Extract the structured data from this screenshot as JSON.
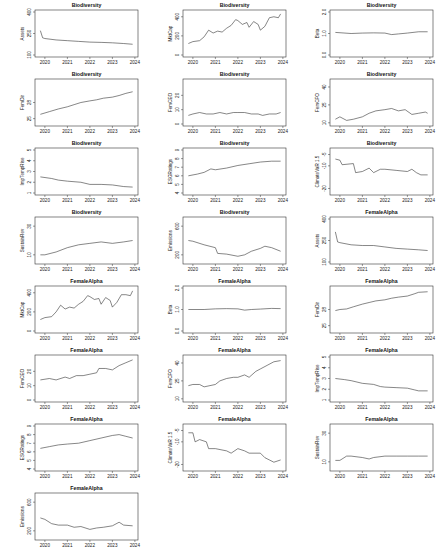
{
  "chart_data": [
    {
      "type": "line",
      "title": "Biodiversity",
      "ylabel": "Assets",
      "xlabel": "",
      "ylim": [
        100,
        400
      ],
      "yticks": [
        "100",
        "250",
        "400"
      ],
      "x_ticks": [
        "2020",
        "2021",
        "2022",
        "2023",
        "2024"
      ],
      "x": [
        2019.8,
        2019.9,
        2020.0,
        2020.5,
        2021.0,
        2021.5,
        2022.0,
        2022.5,
        2023.0,
        2023.5,
        2023.9
      ],
      "values": [
        270,
        220,
        215,
        205,
        200,
        195,
        190,
        188,
        185,
        180,
        175
      ]
    },
    {
      "type": "line",
      "title": "Biodiversity",
      "ylabel": "MktCap",
      "xlabel": "",
      "ylim": [
        0,
        450
      ],
      "yticks": [
        "0",
        "200",
        "400"
      ],
      "x_ticks": [
        "2020",
        "2021",
        "2022",
        "2023",
        "2024"
      ],
      "x": [
        2019.8,
        2020.0,
        2020.3,
        2020.5,
        2020.7,
        2020.9,
        2021.1,
        2021.3,
        2021.5,
        2021.7,
        2021.9,
        2022.0,
        2022.2,
        2022.4,
        2022.5,
        2022.7,
        2022.9,
        2023.0,
        2023.2,
        2023.4,
        2023.6,
        2023.8,
        2023.9
      ],
      "values": [
        120,
        140,
        150,
        190,
        260,
        230,
        250,
        240,
        280,
        310,
        370,
        360,
        320,
        340,
        290,
        350,
        320,
        260,
        300,
        390,
        400,
        390,
        430
      ]
    },
    {
      "type": "line",
      "title": "Biodiversity",
      "ylabel": "Beta",
      "xlabel": "",
      "ylim": [
        0.0,
        2.0
      ],
      "yticks": [
        "0.0",
        "1.0",
        "2.0"
      ],
      "x_ticks": [
        "2020",
        "2021",
        "2022",
        "2023",
        "2024"
      ],
      "x": [
        2019.8,
        2020.5,
        2021.0,
        2021.5,
        2022.0,
        2022.3,
        2022.6,
        2023.0,
        2023.5,
        2023.9
      ],
      "values": [
        1.05,
        1.0,
        1.02,
        1.03,
        1.02,
        0.95,
        0.98,
        1.02,
        1.08,
        1.08
      ]
    },
    {
      "type": "line",
      "title": "Biodiversity",
      "ylabel": "FemDir",
      "xlabel": "",
      "ylim": [
        24,
        32
      ],
      "yticks": [
        "25",
        "28"
      ],
      "x_ticks": [
        "2020",
        "2021",
        "2022",
        "2023",
        "2024"
      ],
      "x": [
        2019.8,
        2020.2,
        2020.6,
        2021.0,
        2021.3,
        2021.6,
        2022.0,
        2022.3,
        2022.6,
        2023.0,
        2023.3,
        2023.6,
        2023.9
      ],
      "values": [
        25.8,
        26.3,
        26.8,
        27.2,
        27.6,
        28.0,
        28.3,
        28.5,
        28.8,
        29.0,
        29.3,
        29.7,
        30.0
      ]
    },
    {
      "type": "line",
      "title": "Biodiversity",
      "ylabel": "FemCEO",
      "xlabel": "",
      "ylim": [
        0,
        30
      ],
      "yticks": [
        "0",
        "10",
        "20"
      ],
      "x_ticks": [
        "2020",
        "2021",
        "2022",
        "2023",
        "2024"
      ],
      "x": [
        2019.8,
        2020.0,
        2020.3,
        2020.6,
        2020.9,
        2021.2,
        2021.5,
        2021.8,
        2022.0,
        2022.3,
        2022.6,
        2022.9,
        2023.1,
        2023.4,
        2023.7,
        2023.9
      ],
      "values": [
        6,
        7,
        8,
        7,
        7,
        8,
        7,
        8,
        8,
        8,
        7,
        7,
        6,
        7,
        7,
        8
      ]
    },
    {
      "type": "line",
      "title": "Biodiversity",
      "ylabel": "FemCFO",
      "xlabel": "",
      "ylim": [
        9,
        45
      ],
      "yticks": [
        "10",
        "25",
        "40"
      ],
      "x_ticks": [
        "2020",
        "2021",
        "2022",
        "2023",
        "2024"
      ],
      "x": [
        2019.8,
        2020.0,
        2020.3,
        2020.6,
        2021.0,
        2021.3,
        2021.6,
        2022.0,
        2022.3,
        2022.6,
        2022.9,
        2023.2,
        2023.5,
        2023.8,
        2023.9
      ],
      "values": [
        13,
        15,
        12,
        13,
        15,
        18,
        20,
        21,
        22,
        20,
        21,
        17,
        18,
        19,
        18
      ]
    },
    {
      "type": "line",
      "title": "Biodiversity",
      "ylabel": "ImpTempRise",
      "xlabel": "",
      "ylim": [
        1,
        5
      ],
      "yticks": [
        "1",
        "2",
        "3",
        "4",
        "5"
      ],
      "x_ticks": [
        "2020",
        "2021",
        "2022",
        "2023",
        "2024"
      ],
      "x": [
        2019.8,
        2020.3,
        2020.6,
        2021.0,
        2021.6,
        2022.0,
        2022.5,
        2023.0,
        2023.5,
        2023.9
      ],
      "values": [
        2.5,
        2.35,
        2.2,
        2.1,
        2.0,
        1.8,
        1.8,
        1.75,
        1.6,
        1.55
      ]
    },
    {
      "type": "line",
      "title": "Biodiversity",
      "ylabel": "ESGRatings",
      "xlabel": "",
      "ylim": [
        4,
        9
      ],
      "yticks": [
        "4",
        "5",
        "6",
        "7",
        "8",
        "9"
      ],
      "x_ticks": [
        "2020",
        "2021",
        "2022",
        "2023",
        "2024"
      ],
      "x": [
        2019.8,
        2020.2,
        2020.5,
        2020.8,
        2021.0,
        2021.5,
        2022.0,
        2022.5,
        2023.0,
        2023.5,
        2023.9
      ],
      "values": [
        6.0,
        6.2,
        6.4,
        6.8,
        6.7,
        6.9,
        7.2,
        7.4,
        7.6,
        7.7,
        7.7
      ]
    },
    {
      "type": "line",
      "title": "Biodiversity",
      "ylabel": "ClimateVaR 1.5",
      "xlabel": "",
      "ylim": [
        -22,
        -3
      ],
      "yticks": [
        "-5",
        "-10",
        "-20"
      ],
      "x_ticks": [
        "2020",
        "2021",
        "2022",
        "2023",
        "2024"
      ],
      "x": [
        2019.8,
        2020.0,
        2020.1,
        2020.6,
        2020.7,
        2021.0,
        2021.3,
        2021.5,
        2021.8,
        2022.0,
        2022.5,
        2023.0,
        2023.2,
        2023.4,
        2023.6,
        2023.9
      ],
      "values": [
        -7,
        -7.5,
        -9.5,
        -9,
        -13,
        -12.5,
        -11,
        -13,
        -11.5,
        -11.5,
        -12,
        -12.5,
        -11.5,
        -13,
        -14,
        -14
      ]
    },
    {
      "type": "line",
      "title": "Biodiversity",
      "ylabel": "SustainRev",
      "xlabel": "",
      "ylim": [
        5,
        35
      ],
      "yticks": [
        "10",
        "30"
      ],
      "x_ticks": [
        "2020",
        "2021",
        "2022",
        "2023",
        "2024"
      ],
      "x": [
        2019.8,
        2020.0,
        2020.5,
        2021.0,
        2021.5,
        2022.0,
        2022.5,
        2023.0,
        2023.5,
        2023.9
      ],
      "values": [
        10,
        10,
        12,
        15,
        17,
        18,
        19,
        18,
        19,
        20
      ]
    },
    {
      "type": "line",
      "title": "Biodiversity",
      "ylabel": "Emissions",
      "xlabel": "",
      "ylim": [
        100,
        700
      ],
      "yticks": [
        "200",
        "600"
      ],
      "x_ticks": [
        "2020",
        "2021",
        "2022",
        "2023",
        "2024"
      ],
      "x": [
        2019.8,
        2020.0,
        2020.5,
        2021.0,
        2021.1,
        2021.5,
        2022.0,
        2022.3,
        2022.6,
        2023.0,
        2023.2,
        2023.5,
        2023.9
      ],
      "values": [
        400,
        390,
        340,
        300,
        220,
        210,
        180,
        200,
        250,
        290,
        320,
        300,
        250
      ]
    },
    {
      "type": "line",
      "title": "FemaleAlpha",
      "ylabel": "Assets",
      "xlabel": "",
      "ylim": [
        100,
        400
      ],
      "yticks": [
        "100",
        "250",
        "400"
      ],
      "x_ticks": [
        "2020",
        "2021",
        "2022",
        "2023",
        "2024"
      ],
      "x": [
        2019.8,
        2019.9,
        2020.0,
        2020.5,
        2021.0,
        2021.5,
        2022.0,
        2022.5,
        2023.0,
        2023.5,
        2023.9
      ],
      "values": [
        310,
        240,
        235,
        220,
        215,
        215,
        205,
        195,
        190,
        185,
        180
      ]
    },
    {
      "type": "line",
      "title": "FemaleAlpha",
      "ylabel": "MktCap",
      "xlabel": "",
      "ylim": [
        0,
        450
      ],
      "yticks": [
        "0",
        "200",
        "400"
      ],
      "x_ticks": [
        "2020",
        "2021",
        "2022",
        "2023",
        "2024"
      ],
      "x": [
        2019.8,
        2020.0,
        2020.3,
        2020.5,
        2020.7,
        2020.9,
        2021.1,
        2021.3,
        2021.5,
        2021.7,
        2021.9,
        2022.0,
        2022.2,
        2022.4,
        2022.5,
        2022.7,
        2022.9,
        2023.0,
        2023.2,
        2023.4,
        2023.6,
        2023.8,
        2023.9
      ],
      "values": [
        120,
        140,
        150,
        200,
        270,
        230,
        250,
        240,
        280,
        310,
        370,
        360,
        330,
        340,
        280,
        350,
        320,
        250,
        300,
        380,
        380,
        370,
        420
      ]
    },
    {
      "type": "line",
      "title": "FemaleAlpha",
      "ylabel": "Beta",
      "xlabel": "",
      "ylim": [
        0.0,
        2.0
      ],
      "yticks": [
        "0.0",
        "1.0",
        "2.0"
      ],
      "x_ticks": [
        "2020",
        "2021",
        "2022",
        "2023",
        "2024"
      ],
      "x": [
        2019.8,
        2020.5,
        2021.0,
        2021.5,
        2022.0,
        2022.3,
        2022.6,
        2023.0,
        2023.5,
        2023.9
      ],
      "values": [
        1.0,
        1.0,
        1.03,
        1.04,
        1.03,
        0.97,
        1.0,
        1.02,
        1.05,
        1.04
      ]
    },
    {
      "type": "line",
      "title": "FemaleAlpha",
      "ylabel": "FemDir",
      "xlabel": "",
      "ylim": [
        24,
        32
      ],
      "yticks": [
        "25",
        "28"
      ],
      "x_ticks": [
        "2020",
        "2021",
        "2022",
        "2023",
        "2024"
      ],
      "x": [
        2019.8,
        2020.0,
        2020.3,
        2020.6,
        2021.0,
        2021.3,
        2021.6,
        2022.0,
        2022.3,
        2022.6,
        2023.0,
        2023.3,
        2023.5,
        2023.9
      ],
      "values": [
        27.8,
        28.0,
        28.1,
        28.5,
        29.0,
        29.3,
        29.6,
        29.8,
        30.1,
        30.3,
        30.5,
        30.9,
        31.2,
        31.3
      ]
    },
    {
      "type": "line",
      "title": "FemaleAlpha",
      "ylabel": "FemCEO",
      "xlabel": "",
      "ylim": [
        0,
        30
      ],
      "yticks": [
        "0",
        "10",
        "20"
      ],
      "x_ticks": [
        "2020",
        "2021",
        "2022",
        "2023",
        "2024"
      ],
      "x": [
        2019.8,
        2020.2,
        2020.5,
        2020.9,
        2021.1,
        2021.4,
        2021.7,
        2022.0,
        2022.3,
        2022.4,
        2022.7,
        2023.0,
        2023.3,
        2023.6,
        2023.9
      ],
      "values": [
        14,
        15,
        14,
        16,
        15,
        17,
        17,
        18,
        19,
        22,
        22,
        21,
        24,
        26,
        28
      ]
    },
    {
      "type": "line",
      "title": "FemaleAlpha",
      "ylabel": "FemCFO",
      "xlabel": "",
      "ylim": [
        9,
        45
      ],
      "yticks": [
        "10",
        "25",
        "40"
      ],
      "x_ticks": [
        "2020",
        "2021",
        "2022",
        "2023",
        "2024"
      ],
      "x": [
        2019.8,
        2020.0,
        2020.3,
        2020.5,
        2021.0,
        2021.2,
        2021.5,
        2021.8,
        2022.0,
        2022.3,
        2022.5,
        2022.8,
        2023.0,
        2023.3,
        2023.6,
        2023.9
      ],
      "values": [
        21,
        22,
        22,
        20,
        22,
        25,
        27,
        28,
        28,
        30,
        28,
        33,
        35,
        38,
        41,
        42
      ]
    },
    {
      "type": "line",
      "title": "FemaleAlpha",
      "ylabel": "ImpTempRise",
      "xlabel": "",
      "ylim": [
        1,
        5
      ],
      "yticks": [
        "1",
        "2",
        "3",
        "4",
        "5"
      ],
      "x_ticks": [
        "2020",
        "2021",
        "2022",
        "2023",
        "2024"
      ],
      "x": [
        2019.8,
        2020.2,
        2020.5,
        2021.0,
        2021.5,
        2021.8,
        2022.0,
        2022.5,
        2023.0,
        2023.3,
        2023.5,
        2023.9
      ],
      "values": [
        3.0,
        2.9,
        2.8,
        2.55,
        2.45,
        2.25,
        2.2,
        2.15,
        2.1,
        1.95,
        1.85,
        1.85
      ]
    },
    {
      "type": "line",
      "title": "FemaleAlpha",
      "ylabel": "ESGRatings",
      "xlabel": "",
      "ylim": [
        4,
        9
      ],
      "yticks": [
        "4",
        "5",
        "6",
        "7",
        "8",
        "9"
      ],
      "x_ticks": [
        "2020",
        "2021",
        "2022",
        "2023",
        "2024"
      ],
      "x": [
        2019.8,
        2020.2,
        2020.6,
        2021.0,
        2021.5,
        2022.0,
        2022.5,
        2023.0,
        2023.3,
        2023.6,
        2023.9
      ],
      "values": [
        6.4,
        6.6,
        6.8,
        6.9,
        7.0,
        7.3,
        7.6,
        7.9,
        8.0,
        7.8,
        7.6
      ]
    },
    {
      "type": "line",
      "title": "FemaleAlpha",
      "ylabel": "ClimateVaR 1.5",
      "xlabel": "",
      "ylim": [
        -22,
        -3
      ],
      "yticks": [
        "-5",
        "-10",
        "-20"
      ],
      "x_ticks": [
        "2020",
        "2021",
        "2022",
        "2023",
        "2024"
      ],
      "x": [
        2019.8,
        2020.0,
        2020.1,
        2020.3,
        2020.6,
        2020.7,
        2021.0,
        2021.5,
        2021.7,
        2022.0,
        2022.3,
        2022.5,
        2023.0,
        2023.2,
        2023.4,
        2023.6,
        2023.9
      ],
      "values": [
        -6,
        -6,
        -10,
        -9,
        -10,
        -13,
        -13,
        -14,
        -15,
        -13,
        -14,
        -15,
        -15,
        -17,
        -18,
        -19,
        -18
      ]
    },
    {
      "type": "line",
      "title": "FemaleAlpha",
      "ylabel": "SustainRev",
      "xlabel": "",
      "ylim": [
        5,
        35
      ],
      "yticks": [
        "10",
        "30"
      ],
      "x_ticks": [
        "2020",
        "2021",
        "2022",
        "2023",
        "2024"
      ],
      "x": [
        2019.8,
        2020.0,
        2020.3,
        2020.5,
        2021.0,
        2021.3,
        2021.5,
        2022.0,
        2022.5,
        2023.0,
        2023.5,
        2023.9
      ],
      "values": [
        11,
        11,
        14,
        14,
        13,
        12,
        13,
        14,
        14,
        14,
        14,
        14
      ]
    },
    {
      "type": "line",
      "title": "FemaleAlpha",
      "ylabel": "Emissions",
      "xlabel": "",
      "ylim": [
        100,
        700
      ],
      "yticks": [
        "200",
        "600"
      ],
      "x_ticks": [
        "2020",
        "2021",
        "2022",
        "2023",
        "2024"
      ],
      "x": [
        2019.8,
        2020.0,
        2020.3,
        2020.6,
        2021.0,
        2021.3,
        2021.6,
        2022.0,
        2022.3,
        2022.6,
        2023.0,
        2023.3,
        2023.5,
        2023.9
      ],
      "values": [
        380,
        360,
        300,
        280,
        280,
        250,
        260,
        220,
        240,
        250,
        270,
        320,
        280,
        270
      ]
    }
  ]
}
